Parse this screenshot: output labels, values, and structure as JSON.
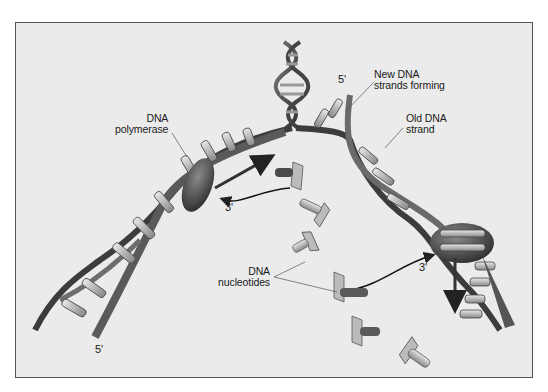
{
  "diagram": {
    "labels": {
      "polymerase": [
        "DNA",
        "polymerase"
      ],
      "new_strands": [
        "New DNA",
        "strands forming"
      ],
      "old_strand": [
        "Old DNA",
        "strand"
      ],
      "nucleotides": [
        "DNA",
        "nucleotides"
      ]
    },
    "ends": {
      "left_bottom": "5'",
      "left_polymerase": "3'",
      "top_right": "5'",
      "right_polymerase": "3'"
    },
    "colors": {
      "background": "#ebebeb",
      "frame": "#555555",
      "ribbon_dark": "#3c3c3c",
      "ribbon_mid": "#6e6e6e",
      "base_light": "#d8d8d8",
      "enzyme": "#4a4a4a"
    }
  }
}
